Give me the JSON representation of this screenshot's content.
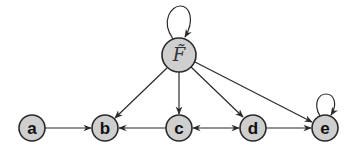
{
  "diagram": {
    "type": "directed-graph",
    "colors": {
      "node_fill": "#cfcfcf",
      "node_stroke": "#2a2a2a",
      "edge": "#2a2a2a"
    },
    "nodes": [
      {
        "id": "F",
        "label": "F̃",
        "x": 179,
        "y": 55,
        "r": 17,
        "self_loop": true
      },
      {
        "id": "a",
        "label": "a",
        "x": 32,
        "y": 128,
        "r": 13,
        "self_loop": false
      },
      {
        "id": "b",
        "label": "b",
        "x": 105,
        "y": 128,
        "r": 13,
        "self_loop": false
      },
      {
        "id": "c",
        "label": "c",
        "x": 179,
        "y": 128,
        "r": 13,
        "self_loop": false
      },
      {
        "id": "d",
        "label": "d",
        "x": 253,
        "y": 128,
        "r": 13,
        "self_loop": false
      },
      {
        "id": "e",
        "label": "e",
        "x": 325,
        "y": 128,
        "r": 13,
        "self_loop": true
      }
    ],
    "edges": [
      {
        "from": "F",
        "to": "F",
        "kind": "self-loop"
      },
      {
        "from": "F",
        "to": "b",
        "kind": "directed"
      },
      {
        "from": "F",
        "to": "c",
        "kind": "directed"
      },
      {
        "from": "F",
        "to": "d",
        "kind": "directed"
      },
      {
        "from": "F",
        "to": "e",
        "kind": "directed"
      },
      {
        "from": "a",
        "to": "b",
        "kind": "directed"
      },
      {
        "from": "c",
        "to": "b",
        "kind": "directed"
      },
      {
        "from": "c",
        "to": "d",
        "kind": "bidirectional"
      },
      {
        "from": "d",
        "to": "e",
        "kind": "directed"
      },
      {
        "from": "e",
        "to": "e",
        "kind": "self-loop"
      }
    ]
  }
}
